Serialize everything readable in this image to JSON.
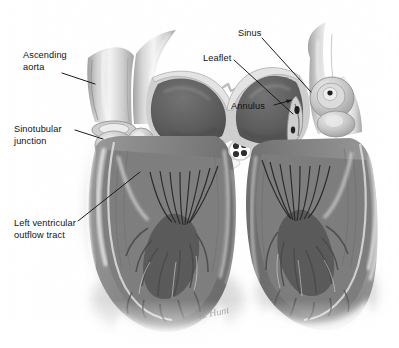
{
  "figure": {
    "background_color": "#ffffff",
    "width": 399,
    "height": 348,
    "style": "grayscale pencil / airbrush medical illustration",
    "view": "two mirrored coronal cross-sections of the left heart",
    "text_color": "#111111",
    "leader_color": "#1a1a1a"
  },
  "labels": [
    {
      "id": "ascending-aorta",
      "text": "Ascending\naorta",
      "x": 23,
      "y": 50,
      "align": "left"
    },
    {
      "id": "sinotubular",
      "text": "Sinotubular\njunction",
      "x": 14,
      "y": 124,
      "align": "left"
    },
    {
      "id": "lvot",
      "text": "Left ventricular\noutflow tract",
      "x": 14,
      "y": 218,
      "align": "left"
    },
    {
      "id": "sinus",
      "text": "Sinus",
      "x": 238,
      "y": 28,
      "align": "left"
    },
    {
      "id": "leaflet",
      "text": "Leaflet",
      "x": 203,
      "y": 53,
      "align": "left"
    },
    {
      "id": "annulus",
      "text": "Annulus",
      "x": 231,
      "y": 101,
      "align": "left"
    }
  ],
  "leaders": [
    {
      "id": "leader-ascending-aorta",
      "points": "62,73 95,84"
    },
    {
      "id": "leader-sinotubular",
      "points": "75,130 103,139"
    },
    {
      "id": "leader-lvot",
      "points": "78,221 140,172"
    },
    {
      "id": "leader-sinus",
      "points": "262,38 311,92"
    },
    {
      "id": "leader-leaflet",
      "points": "234,60 293,114"
    },
    {
      "id": "leader-annulus",
      "points": "274,105 292,100"
    }
  ],
  "structures": [
    {
      "id": "left-ascending-aorta",
      "name": "Ascending aorta (left panel)"
    },
    {
      "id": "left-sinus-bulge",
      "name": "Aortic sinus of Valsalva (left panel)"
    },
    {
      "id": "left-ventricle-chamber",
      "name": "Left ventricular chamber (left panel)"
    },
    {
      "id": "left-chordae",
      "name": "Chordae tendineae (left panel)"
    },
    {
      "id": "left-papillary",
      "name": "Papillary muscle and trabeculae carneae (left panel)"
    },
    {
      "id": "right-ascending-aorta",
      "name": "Ascending aorta (right panel)"
    },
    {
      "id": "right-sinus-bulge",
      "name": "Aortic sinus with coronary ostium (right panel)"
    },
    {
      "id": "right-ventricle-chamber",
      "name": "Left ventricular chamber (right panel)"
    },
    {
      "id": "right-chordae",
      "name": "Chordae tendineae (right panel)"
    },
    {
      "id": "right-papillary",
      "name": "Papillary muscle and trabeculae carneae (right panel)"
    }
  ],
  "signature": {
    "text": "R. Hunt",
    "x": 198,
    "y": 307
  },
  "palette": {
    "background": "#ffffff",
    "muscle_mid": "#8d8d8d",
    "muscle_dark": "#5e5e5e",
    "muscle_shadow": "#3f3f3f",
    "endocardium_light": "#d8d8d8",
    "highlight": "#f2f2f2",
    "aorta_wall": "#c9c9c9",
    "sinus_rim": "#b4b4b4",
    "chordae": "#2a2a2a"
  }
}
